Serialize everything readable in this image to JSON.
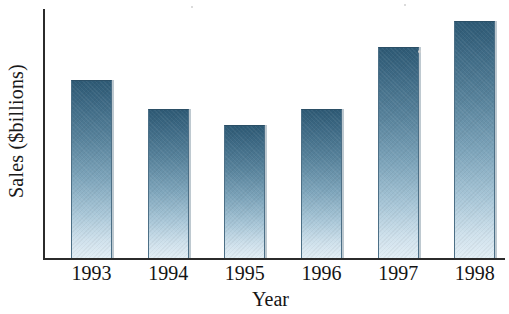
{
  "chart_data": {
    "type": "bar",
    "title": "",
    "subtitle": "",
    "xlabel": "Year",
    "ylabel": "Sales ($billions)",
    "categories": [
      "1993",
      "1994",
      "1995",
      "1996",
      "1997",
      "1998"
    ],
    "values": [
      75,
      63,
      56,
      63,
      89,
      100
    ],
    "value_note": "Relative bar heights normalized to tallest bar (1998 = 100); no numeric y-axis scale or tick values are printed on the chart.",
    "series": [
      {
        "name": "Sales ($billions)",
        "values": [
          75,
          63,
          56,
          63,
          89,
          100
        ]
      }
    ],
    "ylim": [
      0,
      105
    ],
    "y_ticks": [],
    "y_tick_labels": [],
    "grid": false,
    "legend": false,
    "legend_position": "none",
    "annotations": [],
    "bar_style": {
      "fill": "vertical-gradient",
      "gradient_top_color": "#2e5a75",
      "gradient_mid_color": "#7ea5bb",
      "gradient_bottom_color": "#e2eef5",
      "outline_color": "#4c6f86"
    },
    "axis_color": "#2b2b2b",
    "background_color": "#ffffff",
    "text_color": "#141414"
  },
  "axes": {
    "y_title": "Sales ($billions)",
    "x_title": "Year"
  },
  "ticks": {
    "x": [
      "1993",
      "1994",
      "1995",
      "1996",
      "1997",
      "1998"
    ],
    "y": []
  }
}
